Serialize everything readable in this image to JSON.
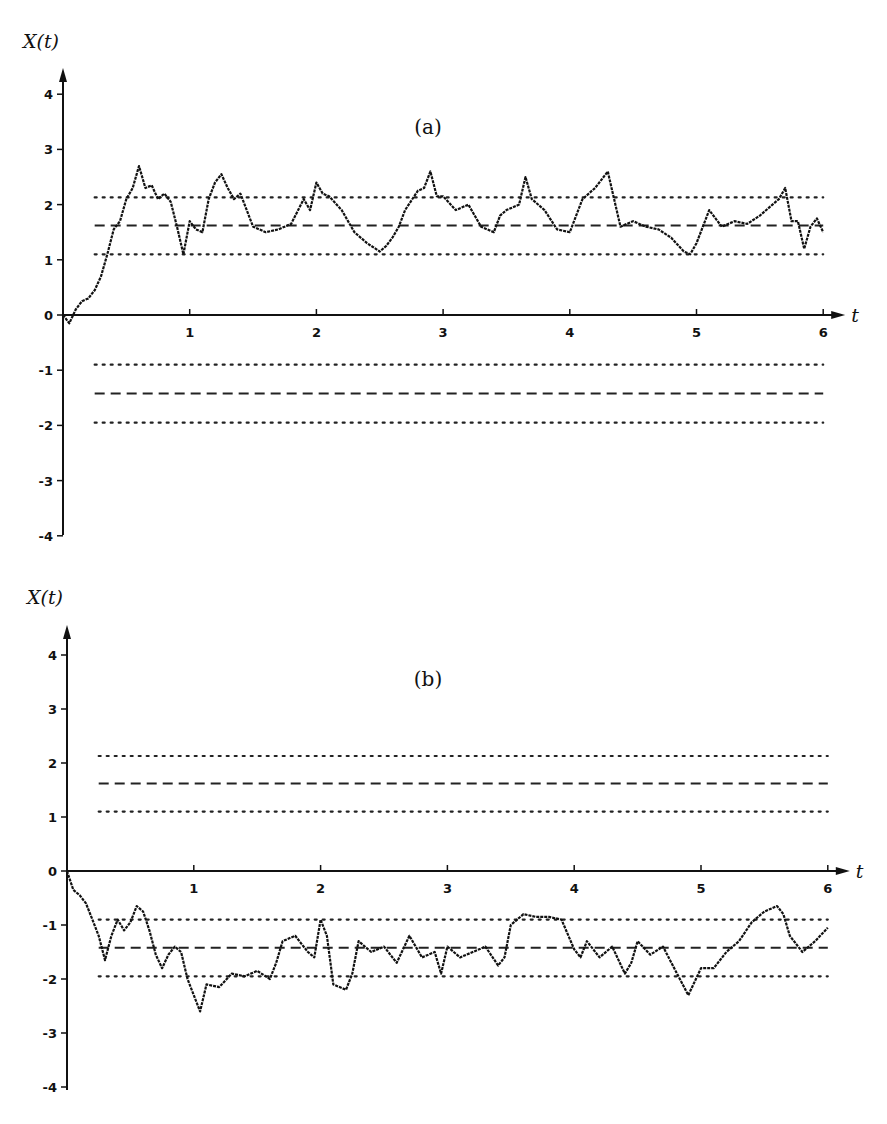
{
  "chart_data": [
    {
      "type": "line",
      "panel_label": "(a)",
      "xlabel": "t",
      "ylabel": "X(t)",
      "xlim": [
        0,
        6
      ],
      "ylim": [
        -4,
        4
      ],
      "xticks": [
        "1",
        "2",
        "3",
        "4",
        "5",
        "6"
      ],
      "yticks": [
        "4",
        "3",
        "2",
        "1",
        "0",
        "-1",
        "-2",
        "-3",
        "-4"
      ],
      "grid": false,
      "reference_lines": [
        {
          "y": 2.13,
          "style": "dotted"
        },
        {
          "y": 1.62,
          "style": "dashed"
        },
        {
          "y": 1.1,
          "style": "dotted"
        },
        {
          "y": -0.9,
          "style": "dotted"
        },
        {
          "y": -1.42,
          "style": "dashed"
        },
        {
          "y": -1.95,
          "style": "dotted"
        }
      ],
      "series": [
        {
          "name": "X(t) sample path",
          "x": [
            0,
            0.05,
            0.1,
            0.15,
            0.2,
            0.25,
            0.3,
            0.35,
            0.4,
            0.45,
            0.5,
            0.55,
            0.6,
            0.65,
            0.7,
            0.75,
            0.8,
            0.85,
            0.9,
            0.95,
            1.0,
            1.05,
            1.1,
            1.15,
            1.2,
            1.25,
            1.3,
            1.35,
            1.4,
            1.5,
            1.6,
            1.7,
            1.8,
            1.9,
            1.95,
            2.0,
            2.05,
            2.1,
            2.2,
            2.3,
            2.4,
            2.5,
            2.55,
            2.6,
            2.65,
            2.7,
            2.8,
            2.85,
            2.9,
            2.95,
            3.0,
            3.1,
            3.2,
            3.3,
            3.4,
            3.45,
            3.5,
            3.6,
            3.65,
            3.7,
            3.8,
            3.9,
            4.0,
            4.1,
            4.2,
            4.3,
            4.35,
            4.4,
            4.5,
            4.6,
            4.7,
            4.8,
            4.9,
            4.95,
            5.0,
            5.1,
            5.2,
            5.3,
            5.4,
            5.5,
            5.6,
            5.65,
            5.7,
            5.75,
            5.8,
            5.85,
            5.9,
            5.95,
            6.0
          ],
          "y": [
            0,
            -0.15,
            0.1,
            0.25,
            0.3,
            0.45,
            0.7,
            1.1,
            1.55,
            1.7,
            2.1,
            2.3,
            2.7,
            2.3,
            2.35,
            2.1,
            2.2,
            2.05,
            1.6,
            1.1,
            1.7,
            1.55,
            1.5,
            2.1,
            2.4,
            2.55,
            2.3,
            2.1,
            2.2,
            1.6,
            1.5,
            1.55,
            1.65,
            2.1,
            1.9,
            2.4,
            2.2,
            2.15,
            1.9,
            1.5,
            1.3,
            1.15,
            1.25,
            1.4,
            1.6,
            1.9,
            2.25,
            2.3,
            2.6,
            2.15,
            2.15,
            1.9,
            2.0,
            1.6,
            1.5,
            1.8,
            1.9,
            2.0,
            2.5,
            2.1,
            1.9,
            1.55,
            1.5,
            2.1,
            2.3,
            2.6,
            2.1,
            1.6,
            1.7,
            1.6,
            1.55,
            1.4,
            1.15,
            1.1,
            1.3,
            1.9,
            1.6,
            1.7,
            1.65,
            1.8,
            2.0,
            2.1,
            2.3,
            1.7,
            1.7,
            1.2,
            1.6,
            1.75,
            1.5
          ]
        }
      ]
    },
    {
      "type": "line",
      "panel_label": "(b)",
      "xlabel": "t",
      "ylabel": "X(t)",
      "xlim": [
        0,
        6
      ],
      "ylim": [
        -4,
        4
      ],
      "xticks": [
        "1",
        "2",
        "3",
        "4",
        "5",
        "6"
      ],
      "yticks": [
        "4",
        "3",
        "2",
        "1",
        "0",
        "-1",
        "-2",
        "-3",
        "-4"
      ],
      "grid": false,
      "reference_lines": [
        {
          "y": 2.13,
          "style": "dotted"
        },
        {
          "y": 1.62,
          "style": "dashed"
        },
        {
          "y": 1.1,
          "style": "dotted"
        },
        {
          "y": -0.9,
          "style": "dotted"
        },
        {
          "y": -1.42,
          "style": "dashed"
        },
        {
          "y": -1.95,
          "style": "dotted"
        }
      ],
      "series": [
        {
          "name": "X(t) sample path",
          "x": [
            0,
            0.05,
            0.1,
            0.15,
            0.2,
            0.25,
            0.3,
            0.35,
            0.4,
            0.45,
            0.5,
            0.55,
            0.6,
            0.65,
            0.7,
            0.75,
            0.8,
            0.85,
            0.9,
            0.95,
            1.0,
            1.05,
            1.1,
            1.2,
            1.3,
            1.4,
            1.5,
            1.6,
            1.65,
            1.7,
            1.8,
            1.9,
            1.95,
            2.0,
            2.05,
            2.1,
            2.2,
            2.25,
            2.3,
            2.4,
            2.5,
            2.6,
            2.7,
            2.8,
            2.9,
            2.95,
            3.0,
            3.1,
            3.2,
            3.3,
            3.4,
            3.45,
            3.5,
            3.6,
            3.7,
            3.8,
            3.9,
            4.0,
            4.05,
            4.1,
            4.2,
            4.3,
            4.4,
            4.45,
            4.5,
            4.6,
            4.7,
            4.8,
            4.9,
            5.0,
            5.1,
            5.2,
            5.3,
            5.4,
            5.5,
            5.6,
            5.65,
            5.7,
            5.8,
            5.9,
            6.0
          ],
          "y": [
            0,
            -0.35,
            -0.45,
            -0.6,
            -0.9,
            -1.2,
            -1.65,
            -1.2,
            -0.9,
            -1.1,
            -0.95,
            -0.65,
            -0.75,
            -1.1,
            -1.55,
            -1.8,
            -1.55,
            -1.4,
            -1.5,
            -2.0,
            -2.3,
            -2.6,
            -2.1,
            -2.15,
            -1.9,
            -1.95,
            -1.85,
            -2.0,
            -1.7,
            -1.3,
            -1.2,
            -1.5,
            -1.6,
            -0.9,
            -1.2,
            -2.1,
            -2.2,
            -1.9,
            -1.3,
            -1.5,
            -1.4,
            -1.7,
            -1.2,
            -1.6,
            -1.5,
            -1.9,
            -1.4,
            -1.6,
            -1.5,
            -1.4,
            -1.75,
            -1.6,
            -1.0,
            -0.8,
            -0.85,
            -0.85,
            -0.9,
            -1.45,
            -1.6,
            -1.3,
            -1.6,
            -1.4,
            -1.9,
            -1.7,
            -1.3,
            -1.55,
            -1.4,
            -1.85,
            -2.3,
            -1.8,
            -1.8,
            -1.5,
            -1.3,
            -0.95,
            -0.75,
            -0.65,
            -0.8,
            -1.2,
            -1.5,
            -1.3,
            -1.05
          ]
        }
      ]
    }
  ],
  "panels": [
    {
      "label": "(a)",
      "ylabel": "X(t)",
      "xlabel": "t"
    },
    {
      "label": "(b)",
      "ylabel": "X(t)",
      "xlabel": "t"
    }
  ]
}
